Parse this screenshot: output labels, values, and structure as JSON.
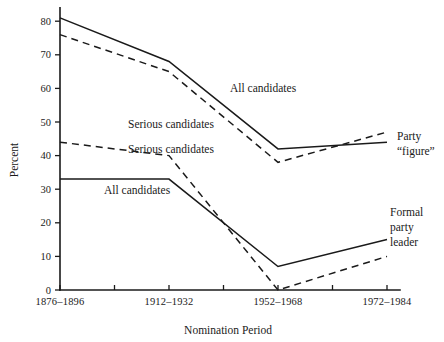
{
  "chart_data": {
    "type": "line",
    "title": "",
    "xlabel": "Nomination Period",
    "ylabel": "Percent",
    "categories": [
      "1876–1896",
      "1912–1932",
      "1952–1968",
      "1972–1984"
    ],
    "x": [
      0,
      1,
      2,
      3
    ],
    "xlim": [
      -0.1,
      3.25
    ],
    "ylim": [
      0,
      84
    ],
    "ytick_labels": [
      "0",
      "10",
      "20",
      "30",
      "40",
      "50",
      "60",
      "70",
      "80"
    ],
    "ytick_values": [
      0,
      10,
      20,
      30,
      40,
      50,
      60,
      70,
      80
    ],
    "grid": false,
    "legend": "inline-annotations",
    "series": [
      {
        "name": "Party \"figure\" — All candidates",
        "style": "solid",
        "group": "Party “figure”",
        "label": "All candidates",
        "values": [
          81,
          68,
          42,
          44
        ]
      },
      {
        "name": "Party \"figure\" — Serious candidates",
        "style": "dashed",
        "group": "Party “figure”",
        "label": "Serious candidates",
        "values": [
          76,
          65,
          38,
          47
        ]
      },
      {
        "name": "Formal party leader — Serious candidates",
        "style": "dashed",
        "group": "Formal party leader",
        "label": "Serious candidates",
        "values": [
          44,
          40,
          0,
          10
        ]
      },
      {
        "name": "Formal party leader — All candidates",
        "style": "solid",
        "group": "Formal party leader",
        "label": "All candidates",
        "values": [
          33,
          33,
          7,
          15
        ]
      }
    ],
    "annotations": [
      {
        "id": "ann-all-candidates-upper",
        "text": "All candidates",
        "x": 230,
        "y": 92,
        "anchor": "start"
      },
      {
        "id": "ann-serious-candidates-upper",
        "text": "Serious candidates",
        "x": 128,
        "y": 128,
        "anchor": "start"
      },
      {
        "id": "ann-serious-candidates-lower",
        "text": "Serious candidates",
        "x": 128,
        "y": 153,
        "anchor": "start"
      },
      {
        "id": "ann-all-candidates-lower",
        "text": "All candidates",
        "x": 104,
        "y": 194,
        "anchor": "start"
      },
      {
        "id": "ann-party-figure-line1",
        "text": "Party",
        "x": 397,
        "y": 140,
        "anchor": "start"
      },
      {
        "id": "ann-party-figure-line2",
        "text": "“figure”",
        "x": 397,
        "y": 155,
        "anchor": "start"
      },
      {
        "id": "ann-formal-party-leader-line1",
        "text": "Formal",
        "x": 390,
        "y": 216,
        "anchor": "start"
      },
      {
        "id": "ann-formal-party-leader-line2",
        "text": "party",
        "x": 390,
        "y": 231,
        "anchor": "start"
      },
      {
        "id": "ann-formal-party-leader-line3",
        "text": "leader",
        "x": 390,
        "y": 246,
        "anchor": "start"
      }
    ],
    "colors": {
      "axis": "#1a1a1a",
      "line": "#1a1a1a",
      "background": "#ffffff"
    }
  }
}
